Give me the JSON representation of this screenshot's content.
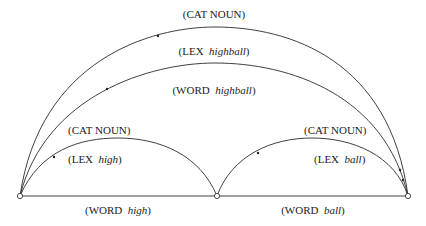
{
  "diagram": {
    "type": "chart-parse / transition network",
    "nodes": [
      {
        "id": "n0",
        "x": 20,
        "y": 196
      },
      {
        "id": "n1",
        "x": 217,
        "y": 196
      },
      {
        "id": "n2",
        "x": 408,
        "y": 196
      }
    ],
    "edges": {
      "outer_cat": {
        "from": "n0",
        "to": "n2",
        "prefix": "(CAT ",
        "value": "NOUN",
        "suffix": ")",
        "italic": false
      },
      "outer_lex": {
        "from": "n0",
        "to": "n2",
        "prefix": "(LEX  ",
        "value": "highball",
        "suffix": ")",
        "italic": true
      },
      "outer_word": {
        "from": "n0",
        "to": "n2",
        "prefix": "(WORD  ",
        "value": "highball",
        "suffix": ")",
        "italic": true
      },
      "left_cat": {
        "from": "n0",
        "to": "n1",
        "prefix": "(CAT ",
        "value": "NOUN",
        "suffix": ")",
        "italic": false
      },
      "left_lex": {
        "from": "n0",
        "to": "n1",
        "prefix": "(LEX  ",
        "value": "high",
        "suffix": ")",
        "italic": true
      },
      "left_word": {
        "from": "n0",
        "to": "n1",
        "prefix": "(WORD  ",
        "value": "high",
        "suffix": ")",
        "italic": true
      },
      "right_cat": {
        "from": "n1",
        "to": "n2",
        "prefix": "(CAT ",
        "value": "NOUN",
        "suffix": ")",
        "italic": false
      },
      "right_lex": {
        "from": "n1",
        "to": "n2",
        "prefix": "(LEX  ",
        "value": "ball",
        "suffix": ")",
        "italic": true
      },
      "right_word": {
        "from": "n1",
        "to": "n2",
        "prefix": "(WORD  ",
        "value": "ball",
        "suffix": ")",
        "italic": true
      }
    }
  }
}
